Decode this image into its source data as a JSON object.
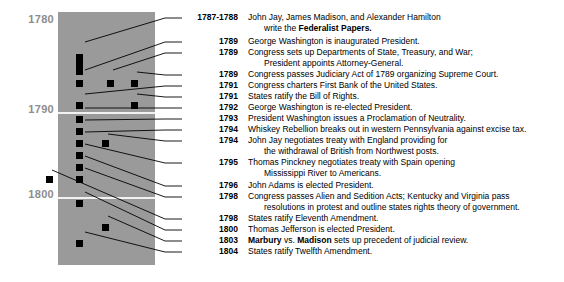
{
  "figure": {
    "type": "timeline",
    "panel_color": "#9a9a9a",
    "marker_color": "#000000",
    "gridline_color": "#f2f2f2",
    "axis_label_color": "#8d8d8d"
  },
  "axis": {
    "labels": [
      {
        "text": "1780",
        "y": 13
      },
      {
        "text": "1790",
        "y": 103
      },
      {
        "text": "1800",
        "y": 188
      }
    ],
    "gridlines": [
      {
        "year": 1790,
        "y": 100
      },
      {
        "year": 1800,
        "y": 185
      }
    ]
  },
  "markers": [
    {
      "name": "marker-1787-1788",
      "x": 18,
      "y": 42,
      "w": 7,
      "h": 21
    },
    {
      "name": "marker-1789-inauguration",
      "x": 18,
      "y": 68,
      "w": 7,
      "h": 7
    },
    {
      "name": "marker-1789-departments",
      "x": 49,
      "y": 68,
      "w": 7,
      "h": 7
    },
    {
      "name": "marker-1789-judiciary",
      "x": 73,
      "y": 68,
      "w": 7,
      "h": 7
    },
    {
      "name": "marker-1791-bank",
      "x": 18,
      "y": 90,
      "w": 7,
      "h": 7
    },
    {
      "name": "marker-1791-bill-of-rights",
      "x": 73,
      "y": 90,
      "w": 7,
      "h": 7
    },
    {
      "name": "marker-1792-reelected",
      "x": 18,
      "y": 104,
      "w": 7,
      "h": 7
    },
    {
      "name": "marker-1793-neutrality",
      "x": 18,
      "y": 116,
      "w": 7,
      "h": 7
    },
    {
      "name": "marker-1794-whiskey",
      "x": 18,
      "y": 128,
      "w": 7,
      "h": 7
    },
    {
      "name": "marker-1794-jay-treaty",
      "x": 44,
      "y": 128,
      "w": 7,
      "h": 7
    },
    {
      "name": "marker-1795-pinckney",
      "x": 18,
      "y": 140,
      "w": 7,
      "h": 7
    },
    {
      "name": "marker-1796-adams",
      "x": 18,
      "y": 152,
      "w": 7,
      "h": 7
    },
    {
      "name": "marker-1798-alien-sedition",
      "x": 18,
      "y": 164,
      "w": 7,
      "h": 7
    },
    {
      "name": "marker-1798-eleventh",
      "x": -12,
      "y": 164,
      "w": 7,
      "h": 7
    },
    {
      "name": "marker-1800-jefferson",
      "x": 18,
      "y": 188,
      "w": 7,
      "h": 7
    },
    {
      "name": "marker-1803-marbury",
      "x": 44,
      "y": 212,
      "w": 7,
      "h": 7
    },
    {
      "name": "marker-1804-twelfth",
      "x": 18,
      "y": 228,
      "w": 7,
      "h": 7
    }
  ],
  "leader_lines": [
    {
      "name": "leader-1787-1788",
      "x1": 85,
      "y1": 42,
      "x2": 165,
      "y2": 18,
      "x3": 182,
      "y3": 18
    },
    {
      "name": "leader-1789-inauguration",
      "x1": 85,
      "y1": 70,
      "x2": 165,
      "y2": 42,
      "x3": 182,
      "y3": 42
    },
    {
      "name": "leader-1789-departments",
      "x1": 113,
      "y1": 70,
      "x2": 165,
      "y2": 53,
      "x3": 182,
      "y3": 53
    },
    {
      "name": "leader-1789-judiciary",
      "x1": 137,
      "y1": 72,
      "x2": 165,
      "y2": 75,
      "x3": 182,
      "y3": 75
    },
    {
      "name": "leader-1791-bank",
      "x1": 85,
      "y1": 94,
      "x2": 165,
      "y2": 86,
      "x3": 182,
      "y3": 86
    },
    {
      "name": "leader-1791-bill-of-rights",
      "x1": 137,
      "y1": 94,
      "x2": 165,
      "y2": 97,
      "x3": 182,
      "y3": 97
    },
    {
      "name": "leader-1792-reelected",
      "x1": 85,
      "y1": 108,
      "x2": 165,
      "y2": 108,
      "x3": 182,
      "y3": 108
    },
    {
      "name": "leader-1793-neutrality",
      "x1": 85,
      "y1": 120,
      "x2": 165,
      "y2": 119,
      "x3": 182,
      "y3": 119
    },
    {
      "name": "leader-1794-whiskey",
      "x1": 85,
      "y1": 132,
      "x2": 165,
      "y2": 130,
      "x3": 182,
      "y3": 130
    },
    {
      "name": "leader-1794-jay-treaty",
      "x1": 108,
      "y1": 134,
      "x2": 165,
      "y2": 141,
      "x3": 182,
      "y3": 141
    },
    {
      "name": "leader-1795-pinckney",
      "x1": 85,
      "y1": 144,
      "x2": 165,
      "y2": 163,
      "x3": 182,
      "y3": 163
    },
    {
      "name": "leader-1796-adams",
      "x1": 85,
      "y1": 156,
      "x2": 165,
      "y2": 186,
      "x3": 182,
      "y3": 186
    },
    {
      "name": "leader-1798-alien-sedition",
      "x1": 85,
      "y1": 168,
      "x2": 165,
      "y2": 197,
      "x3": 182,
      "y3": 197
    },
    {
      "name": "leader-1798-eleventh",
      "x1": 52,
      "y1": 170,
      "x2": 165,
      "y2": 219,
      "x3": 182,
      "y3": 219
    },
    {
      "name": "leader-1800-jefferson",
      "x1": 85,
      "y1": 192,
      "x2": 165,
      "y2": 230,
      "x3": 182,
      "y3": 230
    },
    {
      "name": "leader-1803-marbury",
      "x1": 108,
      "y1": 216,
      "x2": 165,
      "y2": 241,
      "x3": 182,
      "y3": 241
    },
    {
      "name": "leader-1804-twelfth",
      "x1": 85,
      "y1": 232,
      "x2": 165,
      "y2": 252,
      "x3": 182,
      "y3": 252
    }
  ],
  "entries": [
    {
      "name": "entry-federalist-papers",
      "y": 0,
      "year": "1787-1788",
      "line1": "John Jay, James Madison, and Alexander Hamilton",
      "line2_pre": "write the ",
      "line2_bold": "Federalist Papers.",
      "line2_post": ""
    },
    {
      "name": "entry-washington-inaugurated",
      "y": 24,
      "year": "1789",
      "line1": "George Washington is inaugurated President."
    },
    {
      "name": "entry-departments",
      "y": 35,
      "year": "1789",
      "line1": "Congress sets up Departments of State, Treasury, and War;",
      "line2_pre": "President appoints Attorney-General.",
      "line2_bold": "",
      "line2_post": ""
    },
    {
      "name": "entry-judiciary-act",
      "y": 57,
      "year": "1789",
      "line1": "Congress passes Judiciary Act of 1789 organizing Supreme Court."
    },
    {
      "name": "entry-first-bank",
      "y": 68,
      "year": "1791",
      "line1": "Congress charters First Bank of the United States."
    },
    {
      "name": "entry-bill-of-rights",
      "y": 79,
      "year": "1791",
      "line1": "States ratify the Bill of Rights."
    },
    {
      "name": "entry-washington-reelected",
      "y": 90,
      "year": "1792",
      "line1": "George Washington is re-elected President."
    },
    {
      "name": "entry-neutrality",
      "y": 101,
      "year": "1793",
      "line1": "President Washington issues a Proclamation of Neutrality."
    },
    {
      "name": "entry-whiskey-rebellion",
      "y": 112,
      "year": "1794",
      "line1": "Whiskey Rebellion breaks out in western Pennsylvania against excise tax."
    },
    {
      "name": "entry-jay-treaty",
      "y": 123,
      "year": "1794",
      "line1": "John Jay negotiates treaty with England providing for",
      "line2_pre": "the withdrawal of British from Northwest posts.",
      "line2_bold": "",
      "line2_post": ""
    },
    {
      "name": "entry-pinckney-treaty",
      "y": 145,
      "year": "1795",
      "line1": "Thomas Pinckney negotiates treaty with Spain opening",
      "line2_pre": "Mississippi River to Americans.",
      "line2_bold": "",
      "line2_post": ""
    },
    {
      "name": "entry-adams-elected",
      "y": 168,
      "year": "1796",
      "line1": "John Adams is elected President."
    },
    {
      "name": "entry-alien-sedition",
      "y": 179,
      "year": "1798",
      "line1": "Congress passes Alien and Sedition Acts; Kentucky and Virginia pass",
      "line2_pre": "resolutions in protest and outline states rights theory of government.",
      "line2_bold": "",
      "line2_post": ""
    },
    {
      "name": "entry-eleventh-amendment",
      "y": 201,
      "year": "1798",
      "line1": "States ratify Eleventh Amendment."
    },
    {
      "name": "entry-jefferson-elected",
      "y": 212,
      "year": "1800",
      "line1": "Thomas Jefferson is elected President."
    },
    {
      "name": "entry-marbury-madison",
      "y": 223,
      "year": "1803",
      "line1_pre": "",
      "line1_bold1": "Marbury",
      "line1_mid": " vs. ",
      "line1_bold2": "Madison",
      "line1_post": " sets up precedent of judicial review."
    },
    {
      "name": "entry-twelfth-amendment",
      "y": 234,
      "year": "1804",
      "line1": "States ratify Twelfth Amendment."
    }
  ]
}
